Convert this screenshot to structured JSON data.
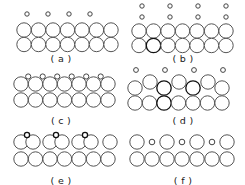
{
  "figure": {
    "background_color": "#ffffff",
    "substrate_stroke_color": "#555555",
    "adatom_stroke_color": "#444444",
    "highlight_stroke_color": "#111111",
    "fill_color": "#ffffff",
    "panel_count": 6,
    "columns": 2,
    "rows": 3
  },
  "panels": [
    {
      "id": "a",
      "label": "( a )",
      "caption": "( a )",
      "description": "Two full substrate rows with a sparse row of four small adatoms above, spaced every other site",
      "substrate_rows": 2,
      "substrate_per_row": 7,
      "adatom_count": 4,
      "adatom_radius": 2.2,
      "substrate_radius": 7.2,
      "coverage": "1/4"
    },
    {
      "id": "b",
      "label": "( b )",
      "caption": "( b )",
      "description": "Two full substrate rows with two sparse rows of four small adatoms above; one substrate circle drawn dark",
      "substrate_rows": 2,
      "substrate_per_row": 7,
      "adatom_count": 8,
      "adatom_radius": 2.2,
      "substrate_radius": 7.2,
      "coverage": "1/4"
    },
    {
      "id": "c",
      "label": "( c )",
      "caption": "( c )",
      "description": "Two substrate rows; small adatoms sit in the bridge hollows between the upper-row large circles",
      "substrate_rows": 2,
      "substrate_per_row": 7,
      "adatom_count": 6,
      "adatom_radius": 2.6,
      "substrate_radius": 7.2,
      "coverage": "bridge sites"
    },
    {
      "id": "d",
      "label": "( d )",
      "caption": "( d )",
      "description": "Buckled reconstruction: upper substrate row alternates raised and lowered circles with small adatoms above; several circles drawn dark",
      "substrate_rows": 2,
      "substrate_per_row": 7,
      "adatom_count": 4,
      "adatom_radius": 2.4,
      "substrate_radius": 7.2,
      "coverage": "buckled"
    },
    {
      "id": "e",
      "label": "( e )",
      "caption": "( e )",
      "description": "Dimerized top row: large circles pair up into three touching dimers plus one lone circle, each dimer capped by a small adatom",
      "substrate_rows": 2,
      "substrate_per_row": 7,
      "adatom_count": 3,
      "adatom_radius": 2.6,
      "substrate_radius": 7.2,
      "coverage": "dimers"
    },
    {
      "id": "f",
      "label": "( f )",
      "caption": "( f )",
      "description": "Top row alternates four large circles with three small circles; full substrate row beneath",
      "substrate_rows": 2,
      "substrate_per_row": 7,
      "adatom_count": 3,
      "adatom_radius": 2.8,
      "substrate_radius": 7.2,
      "coverage": "alternating"
    }
  ]
}
